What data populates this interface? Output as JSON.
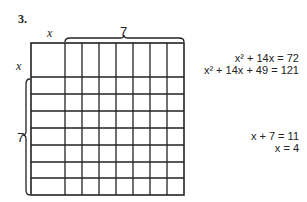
{
  "problem_number": "3.",
  "diagram": {
    "top_label_x": "x",
    "top_label_7": "7",
    "left_label_x": "x",
    "left_label_7": "7",
    "grid": {
      "big_square": "x by x",
      "columns_of_unit": 7,
      "rows_of_unit": 7
    }
  },
  "equations": {
    "line1": "x² + 14x = 72",
    "line2": "x² + 14x + 49 = 121",
    "line3": "x + 7 = 11",
    "line4": "x = 4"
  }
}
